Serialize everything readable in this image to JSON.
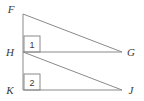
{
  "figure": {
    "background_color": "#ffffff",
    "line_color": "#8a8a8a",
    "label_color": "#3a3a3a",
    "vertices": [
      {
        "id": "F",
        "label": "F",
        "x": 23,
        "y": 14,
        "label_x": 11,
        "label_y": 13
      },
      {
        "id": "H",
        "label": "H",
        "x": 23,
        "y": 52,
        "label_x": 9,
        "label_y": 56
      },
      {
        "id": "K",
        "label": "K",
        "x": 23,
        "y": 90,
        "label_x": 9,
        "label_y": 94
      },
      {
        "id": "G",
        "label": "G",
        "x": 122,
        "y": 52,
        "label_x": 128,
        "label_y": 56
      },
      {
        "id": "J",
        "label": "J",
        "x": 122,
        "y": 90,
        "label_x": 129,
        "label_y": 94
      }
    ],
    "segments": [
      {
        "id": "FK",
        "from": "F",
        "to": "K",
        "description": "vertical-left-side"
      },
      {
        "id": "FG",
        "from": "F",
        "to": "G",
        "description": "upper-hypotenuse"
      },
      {
        "id": "HG",
        "from": "H",
        "to": "G",
        "description": "upper-base"
      },
      {
        "id": "HJ",
        "from": "H",
        "to": "J",
        "description": "lower-hypotenuse"
      },
      {
        "id": "KJ",
        "from": "K",
        "to": "J",
        "description": "lower-base"
      }
    ],
    "angle_marks": [
      {
        "id": "angle-1",
        "label": "1",
        "box_x": 24,
        "box_y": 36,
        "box_w": 16,
        "box_h": 16,
        "text_x": 32,
        "text_y": 48
      },
      {
        "id": "angle-2",
        "label": "2",
        "box_x": 24,
        "box_y": 74,
        "box_w": 16,
        "box_h": 16,
        "text_x": 32,
        "text_y": 86
      }
    ]
  }
}
